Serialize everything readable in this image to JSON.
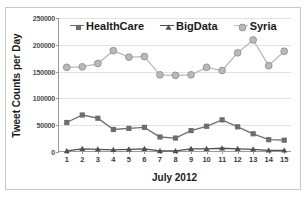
{
  "chart_data": {
    "type": "line",
    "title": "",
    "xlabel": "July 2012",
    "ylabel": "Tweet Counts per Day",
    "categories": [
      "1",
      "2",
      "3",
      "4",
      "5",
      "6",
      "7",
      "8",
      "9",
      "10",
      "11",
      "12",
      "13",
      "14",
      "15"
    ],
    "x": [
      1,
      2,
      3,
      4,
      5,
      6,
      7,
      8,
      9,
      10,
      11,
      12,
      13,
      14,
      15
    ],
    "ylim": [
      0,
      250000
    ],
    "yticks": [
      0,
      50000,
      100000,
      150000,
      200000,
      250000
    ],
    "ytick_labels": [
      "0",
      "50000",
      "100000",
      "150000",
      "200000",
      "250000"
    ],
    "grid": "horizontal",
    "legend_position": "top",
    "series": [
      {
        "name": "HealthCare",
        "marker": "square",
        "color": "#6d6d6d",
        "values": [
          55000,
          69000,
          63000,
          42000,
          44000,
          46000,
          28000,
          26000,
          40000,
          48000,
          60000,
          47000,
          34000,
          23000,
          22000
        ]
      },
      {
        "name": "BigData",
        "marker": "triangle",
        "color": "#4f4f4f",
        "values": [
          2000,
          6000,
          5000,
          4000,
          5000,
          6000,
          2000,
          2000,
          6000,
          6000,
          7000,
          6000,
          5000,
          3000,
          3000
        ]
      },
      {
        "name": "Syria",
        "marker": "circle",
        "color": "#b9b9b9",
        "values": [
          158000,
          159000,
          165000,
          189000,
          177000,
          178000,
          144000,
          143000,
          144000,
          158000,
          152000,
          185000,
          209000,
          161000,
          188000
        ]
      }
    ]
  },
  "legend": {
    "items": [
      {
        "label": "HealthCare",
        "marker": "square-marker-icon"
      },
      {
        "label": "BigData",
        "marker": "triangle-marker-icon"
      },
      {
        "label": "Syria",
        "marker": "circle-marker-icon"
      }
    ]
  },
  "axes": {
    "y_title": "Tweet Counts per Day",
    "x_title": "July 2012"
  },
  "colors": {
    "healthcare": "#6d6d6d",
    "bigdata": "#4f4f4f",
    "syria": "#b9b9b9",
    "grid": "#e2e2e2",
    "axis": "#9a9a9a",
    "frame": "#c9c9c9"
  }
}
